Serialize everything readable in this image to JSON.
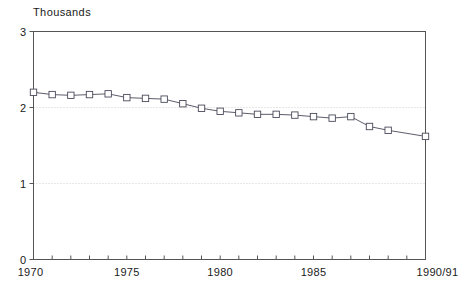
{
  "unit_label": "Thousands",
  "axis_color": "#555555",
  "grid_color": "#cfcfcf",
  "line_color": "#4a4a5a",
  "marker_color": "#4a4a5a",
  "chart_data": {
    "type": "line",
    "title": "",
    "subtitle": "",
    "unit_label": "Thousands",
    "xlabel": "",
    "ylabel": "",
    "ylim": [
      0,
      3
    ],
    "yticks": [
      0,
      1,
      2,
      3
    ],
    "ytick_labels": [
      "0",
      "1",
      "2",
      "3"
    ],
    "xlim": [
      1970,
      1991
    ],
    "xticks": [
      1970,
      1975,
      1980,
      1985,
      1991
    ],
    "xtick_labels": [
      "1970",
      "1975",
      "1980",
      "1985",
      "1990/91"
    ],
    "x_minor_ticks_every": 1,
    "grid": "horizontal-dotted",
    "legend": "none",
    "marker": "square-open",
    "x": [
      1970,
      1971,
      1972,
      1973,
      1974,
      1975,
      1976,
      1977,
      1978,
      1979,
      1980,
      1981,
      1982,
      1983,
      1984,
      1985,
      1986,
      1987,
      1988,
      1989,
      1991
    ],
    "categories": [
      "1970",
      "1971",
      "1972",
      "1973",
      "1974",
      "1975",
      "1976",
      "1977",
      "1978",
      "1979",
      "1980",
      "1981",
      "1982",
      "1983",
      "1984",
      "1985",
      "1986",
      "1987",
      "1988",
      "1989",
      "1990/91"
    ],
    "values": [
      2.2,
      2.17,
      2.16,
      2.17,
      2.18,
      2.13,
      2.12,
      2.11,
      2.05,
      1.99,
      1.95,
      1.93,
      1.91,
      1.91,
      1.9,
      1.88,
      1.86,
      1.88,
      1.75,
      1.7,
      1.62
    ],
    "series": [
      {
        "name": "",
        "values": [
          2.2,
          2.17,
          2.16,
          2.17,
          2.18,
          2.13,
          2.12,
          2.11,
          2.05,
          1.99,
          1.95,
          1.93,
          1.91,
          1.91,
          1.9,
          1.88,
          1.86,
          1.88,
          1.75,
          1.7,
          1.62
        ]
      }
    ]
  }
}
